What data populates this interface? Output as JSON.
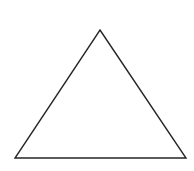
{
  "figure": {
    "kind": "geometric-line-drawing",
    "shape_name": "triangle",
    "canvas": {
      "width": 194,
      "height": 171,
      "background_color": "#ffffff"
    },
    "stroke": {
      "color": "#262626",
      "width_px": 1.4
    },
    "fill_color": "#ffffff",
    "vertices": [
      {
        "label": "apex",
        "x": 100,
        "y": 30
      },
      {
        "label": "bottom-right",
        "x": 186,
        "y": 158
      },
      {
        "label": "bottom-left",
        "x": 15,
        "y": 158
      }
    ],
    "points_attr": "100,30 186,158 15,158",
    "edges": [
      {
        "name": "left-side",
        "from": "bottom-left",
        "to": "apex"
      },
      {
        "name": "right-side",
        "from": "apex",
        "to": "bottom-right"
      },
      {
        "name": "base",
        "from": "bottom-left",
        "to": "bottom-right"
      }
    ],
    "labels": [],
    "caption": ""
  }
}
